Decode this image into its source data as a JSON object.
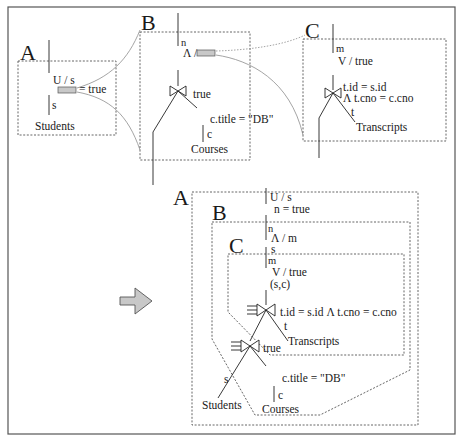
{
  "figure": {
    "before": {
      "A": {
        "box_label": "A",
        "op_label": "U / s",
        "placeholder_result": "= true",
        "edge_label": "s",
        "table": "Students"
      },
      "B": {
        "box_label": "B",
        "edge_in": "n",
        "op_label": "Λ /",
        "join_cond": "true",
        "select_cond": "c.title = \"DB\"",
        "edge_label": "c",
        "table": "Courses"
      },
      "C": {
        "box_label": "C",
        "edge_in": "m",
        "op_label": "V / true",
        "join_cond_1": "t.id = s.id",
        "join_cond_2": "Λ t.cno = c.cno",
        "edge_label": "t",
        "table": "Transcripts"
      }
    },
    "after": {
      "A": {
        "box_label": "A",
        "op_label": "U / s",
        "cond": "n = true"
      },
      "B": {
        "box_label": "B",
        "edge_in": "n",
        "op_label": "Λ / m",
        "edge_out": "s"
      },
      "C": {
        "box_label": "C",
        "edge_in": "m",
        "op_label": "V / true",
        "edge_out": "(s,c)"
      },
      "join_top": {
        "cond": "t.id = s.id Λ t.cno = c.cno",
        "edge_label": "t",
        "table": "Transcripts"
      },
      "join_bottom": {
        "cond": "true",
        "left_edge": "s",
        "left_table": "Students",
        "select_cond": "c.title = \"DB\"",
        "right_edge": "c",
        "right_table": "Courses"
      }
    },
    "arrow": "right-arrow-icon",
    "colors": {
      "placeholder_fill": "#c8c8c8",
      "arrow_fill": "#c8c8c8",
      "frame": "#555555"
    }
  }
}
